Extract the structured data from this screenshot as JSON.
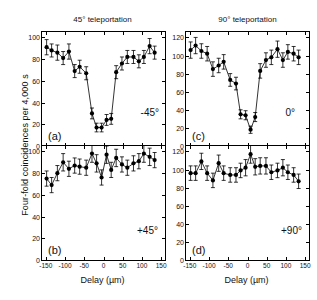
{
  "figure": {
    "ylabel": "Four-fold coincidences per 4,000 s",
    "xlabel": "Delay (µm)",
    "column_titles": [
      "45° teleportation",
      "90° teleportation"
    ]
  },
  "chart_data": [
    {
      "type": "line",
      "panel": "a",
      "panel_letter": "(a)",
      "annotation": "-45°",
      "title": "45° teleportation",
      "xlabel": "Delay (µm)",
      "ylabel": "Four-fold coincidences per 4,000 s",
      "xlim": [
        -160,
        160
      ],
      "ylim": [
        0,
        105
      ],
      "xticks": [
        -150,
        -100,
        -50,
        0,
        50,
        100,
        150
      ],
      "yticks": [
        0,
        20,
        40,
        60,
        80,
        100
      ],
      "grid": false,
      "legend": false,
      "errorbars": true,
      "x": [
        -148,
        -135,
        -120,
        -105,
        -90,
        -75,
        -62,
        -45,
        -30,
        -18,
        -5,
        8,
        20,
        33,
        48,
        62,
        78,
        92,
        105,
        120,
        133
      ],
      "y": [
        91,
        88,
        86,
        81,
        87,
        69,
        73,
        67,
        30,
        17,
        17,
        24,
        25,
        68,
        76,
        82,
        82,
        78,
        82,
        92,
        86
      ],
      "yerr": [
        7,
        6,
        7,
        6,
        7,
        6,
        6,
        6,
        5,
        4,
        4,
        5,
        5,
        6,
        6,
        6,
        6,
        6,
        6,
        7,
        6
      ]
    },
    {
      "type": "line",
      "panel": "b",
      "panel_letter": "(b)",
      "annotation": "+45°",
      "title": "45° teleportation",
      "xlabel": "Delay (µm)",
      "ylabel": "Four-fold coincidences per 4,000 s",
      "xlim": [
        -160,
        160
      ],
      "ylim": [
        0,
        105
      ],
      "xticks": [
        -150,
        -100,
        -50,
        0,
        50,
        100,
        150
      ],
      "yticks": [
        0,
        20,
        40,
        60,
        80,
        100
      ],
      "grid": false,
      "legend": false,
      "errorbars": true,
      "x": [
        -148,
        -135,
        -120,
        -105,
        -90,
        -75,
        -62,
        -45,
        -30,
        -18,
        -5,
        8,
        20,
        33,
        48,
        62,
        78,
        92,
        105,
        120,
        133
      ],
      "y": [
        75,
        69,
        80,
        90,
        84,
        87,
        86,
        85,
        98,
        89,
        76,
        97,
        83,
        94,
        88,
        85,
        89,
        91,
        98,
        95,
        92
      ],
      "yerr": [
        7,
        7,
        7,
        8,
        7,
        7,
        7,
        7,
        8,
        8,
        7,
        8,
        7,
        8,
        7,
        7,
        7,
        7,
        8,
        8,
        7
      ]
    },
    {
      "type": "line",
      "panel": "c",
      "panel_letter": "(c)",
      "annotation": "0°",
      "title": "90° teleportation",
      "xlabel": "Delay (µm)",
      "ylabel": "Four-fold coincidences per 4,000 s",
      "xlim": [
        -160,
        160
      ],
      "ylim": [
        0,
        126
      ],
      "xticks": [
        -150,
        -100,
        -50,
        0,
        50,
        100,
        150
      ],
      "yticks": [
        0,
        20,
        40,
        60,
        80,
        100,
        120
      ],
      "grid": false,
      "legend": false,
      "errorbars": true,
      "x": [
        -148,
        -135,
        -120,
        -105,
        -90,
        -75,
        -62,
        -45,
        -30,
        -18,
        -5,
        8,
        20,
        33,
        48,
        62,
        78,
        92,
        105,
        120,
        133
      ],
      "y": [
        106,
        111,
        105,
        102,
        85,
        89,
        93,
        73,
        69,
        35,
        34,
        18,
        32,
        83,
        95,
        98,
        107,
        95,
        104,
        102,
        98
      ],
      "yerr": [
        9,
        9,
        8,
        8,
        8,
        8,
        8,
        7,
        7,
        5,
        5,
        4,
        5,
        8,
        8,
        8,
        9,
        8,
        8,
        8,
        8
      ]
    },
    {
      "type": "line",
      "panel": "d",
      "panel_letter": "(d)",
      "annotation": "+90°",
      "title": "90° teleportation",
      "xlabel": "Delay (µm)",
      "ylabel": "Four-fold coincidences per 4,000 s",
      "xlim": [
        -160,
        160
      ],
      "ylim": [
        0,
        126
      ],
      "xticks": [
        -150,
        -100,
        -50,
        0,
        50,
        100,
        150
      ],
      "yticks": [
        0,
        20,
        40,
        60,
        80,
        100,
        120
      ],
      "grid": false,
      "legend": false,
      "errorbars": true,
      "x": [
        -148,
        -135,
        -120,
        -105,
        -90,
        -75,
        -62,
        -45,
        -30,
        -18,
        -5,
        8,
        20,
        33,
        48,
        62,
        78,
        92,
        105,
        120,
        133
      ],
      "y": [
        96,
        96,
        109,
        96,
        88,
        107,
        96,
        94,
        94,
        99,
        102,
        117,
        103,
        104,
        104,
        97,
        99,
        102,
        97,
        94,
        87
      ],
      "yerr": [
        8,
        8,
        9,
        8,
        8,
        9,
        8,
        8,
        8,
        8,
        9,
        10,
        9,
        9,
        9,
        8,
        8,
        9,
        8,
        8,
        8
      ]
    }
  ]
}
